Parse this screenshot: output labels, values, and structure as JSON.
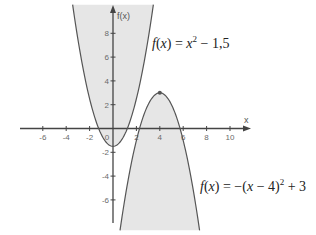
{
  "chart_data": {
    "type": "line",
    "title": "",
    "xlabel": "x",
    "ylabel": "f(x)",
    "xlim": [
      -8,
      11.5
    ],
    "ylim": [
      -8.5,
      10.8
    ],
    "grid": false,
    "x_ticks": [
      -6,
      -4,
      -2,
      0,
      2,
      4,
      6,
      8,
      10
    ],
    "y_ticks": [
      8,
      6,
      4,
      2,
      -2,
      -4,
      -6
    ],
    "series": [
      {
        "name": "f(x) = x^2 - 1,5",
        "expression": "x^2 - 1.5",
        "vertex": [
          0,
          -1.5
        ],
        "shaded": "inside (above curve)",
        "x_range": [
          -3.45,
          3.45
        ],
        "points": [
          [
            -3.4,
            10.06
          ],
          [
            -3,
            7.5
          ],
          [
            -2,
            2.5
          ],
          [
            -1,
            -0.5
          ],
          [
            0,
            -1.5
          ],
          [
            1,
            -0.5
          ],
          [
            2,
            2.5
          ],
          [
            3,
            7.5
          ],
          [
            3.4,
            10.06
          ]
        ]
      },
      {
        "name": "f(x) = -(x-4)^2 + 3",
        "expression": "-(x-4)^2 + 3",
        "vertex": [
          4,
          3
        ],
        "vertex_marked": true,
        "shaded": "inside (below curve)",
        "x_range": [
          0.6,
          7.4
        ],
        "points": [
          [
            0.6,
            -8.56
          ],
          [
            1,
            -6
          ],
          [
            2,
            -1
          ],
          [
            3,
            2
          ],
          [
            4,
            3
          ],
          [
            5,
            2
          ],
          [
            6,
            -1
          ],
          [
            7,
            -6
          ],
          [
            7.4,
            -8.56
          ]
        ]
      }
    ],
    "annotations": [
      {
        "text": "f(x) = x² − 1,5",
        "position": "upper right of first parabola"
      },
      {
        "text": "f(x) = −(x − 4)² + 3",
        "position": "lower right of second parabola"
      }
    ]
  },
  "axes": {
    "x_label": "x",
    "y_label": "f(x)",
    "x_tick_labels": [
      "-6",
      "-4",
      "-2",
      "0",
      "2",
      "4",
      "6",
      "8",
      "10"
    ],
    "y_tick_labels": [
      "8",
      "6",
      "4",
      "2",
      "-2",
      "-4",
      "-6"
    ]
  },
  "labels": {
    "f1": {
      "f": "f",
      "open": "(",
      "x": "x",
      "close": ")",
      "eq": " = ",
      "x2": "x",
      "exp": "2",
      "rest": " − 1,5"
    },
    "f2": {
      "f": "f",
      "open": "(",
      "x": "x",
      "close": ")",
      "eq": " = −(",
      "x2": "x",
      "mid": " − 4)",
      "exp": "2",
      "rest": " + 3"
    }
  },
  "colors": {
    "fill": "#e6e6e6",
    "curve": "#555555",
    "axis": "#444444",
    "text": "#222222",
    "tick_text": "#6a6a6a"
  }
}
